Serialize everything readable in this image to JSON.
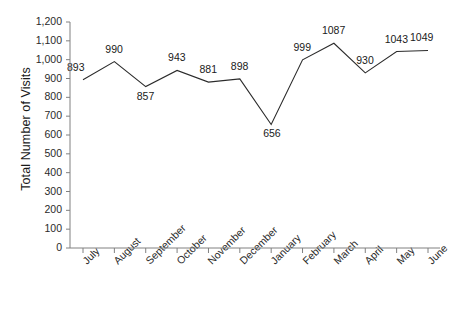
{
  "chart_data": {
    "type": "line",
    "title": "",
    "xlabel": "",
    "ylabel": "Total Number of Visits",
    "categories": [
      "July",
      "August",
      "September",
      "October",
      "November",
      "December",
      "January",
      "February",
      "March",
      "April",
      "May",
      "June"
    ],
    "values": [
      893,
      990,
      857,
      943,
      881,
      898,
      656,
      999,
      1087,
      930,
      1043,
      1049
    ],
    "data_labels": [
      "893",
      "990",
      "857",
      "943",
      "881",
      "898",
      "656",
      "999",
      "1087",
      "930",
      "1043",
      "1049"
    ],
    "ylim": [
      0,
      1200
    ],
    "ytick_values": [
      0,
      100,
      200,
      300,
      400,
      500,
      600,
      700,
      800,
      900,
      1000,
      1100,
      1200
    ],
    "ytick_labels": [
      "0",
      "100",
      "200",
      "300",
      "400",
      "500",
      "600",
      "700",
      "800",
      "900",
      "1,000",
      "1,100",
      "1,200"
    ],
    "grid": false,
    "legend": false,
    "series_color": "#2b2b2b",
    "axis_color": "#808080"
  }
}
